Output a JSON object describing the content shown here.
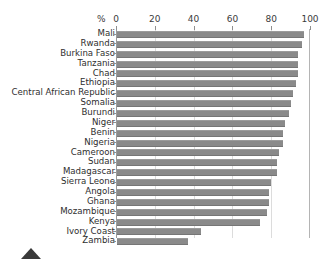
{
  "chart_data": {
    "type": "bar",
    "orientation": "horizontal",
    "title": "",
    "xlabel": "%",
    "ylabel": "",
    "xlim": [
      0,
      100
    ],
    "xticks": [
      0,
      20,
      40,
      60,
      80,
      100
    ],
    "grid": true,
    "legend": false,
    "bar_color": "#8a8a8a",
    "categories": [
      "Mali",
      "Rwanda",
      "Burkina Faso",
      "Tanzania",
      "Chad",
      "Ethiopia",
      "Central African Republic",
      "Somalia",
      "Burundi",
      "Niger",
      "Benin",
      "Nigeria",
      "Cameroon",
      "Sudan",
      "Madagascar",
      "Sierra Leone",
      "Angola",
      "Ghana",
      "Mozambique",
      "Kenya",
      "Ivory Coast",
      "Zambia"
    ],
    "values": [
      97,
      96,
      94,
      94,
      94,
      93,
      91,
      90,
      89,
      87,
      86,
      86,
      84,
      83,
      83,
      80,
      79,
      79,
      78,
      74,
      44,
      37
    ]
  },
  "axis": {
    "percent_symbol": "%",
    "tick_labels": [
      "0",
      "20",
      "40",
      "60",
      "80",
      "100"
    ]
  },
  "marker": {
    "name": "triangle-up-marker"
  }
}
